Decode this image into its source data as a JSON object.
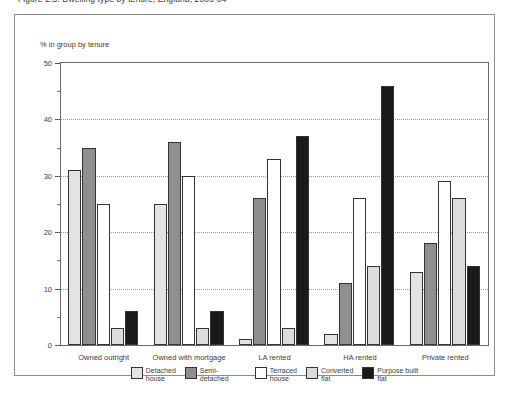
{
  "figure": {
    "title_clipped": "Figure 2.5: Dwelling type by tenure, England, 2003-04",
    "axis_title": "% in group by tenure"
  },
  "chart_data": {
    "type": "bar",
    "title": "",
    "xlabel": "",
    "ylabel": "% in group by tenure",
    "ylim": [
      0,
      50
    ],
    "ytick_step": 10,
    "yminor_step": 5,
    "grid": "horizontal-dotted",
    "legend_position": "bottom-center",
    "ytick_labels": [
      "0",
      "10",
      "20",
      "30",
      "40",
      "50"
    ],
    "categories": [
      "Owned outright",
      "Owned with mortgage",
      "LA rented",
      "HA rented",
      "Private rented"
    ],
    "series": [
      {
        "name": "Detached\nhouse",
        "legend_label": "Detached\nhouse",
        "color": "#e3e3e3",
        "values": [
          31,
          25,
          1,
          2,
          13
        ]
      },
      {
        "name": "Semi-detached",
        "legend_label": "Semi-detached",
        "color": "#8f8f8f",
        "values": [
          35,
          36,
          26,
          11,
          18
        ]
      },
      {
        "name": "Terraced\nhouse",
        "legend_label": "Terraced\nhouse",
        "color": "#ffffff",
        "values": [
          25,
          30,
          33,
          26,
          29
        ]
      },
      {
        "name": "Converted\nflat",
        "legend_label": "Converted\nflat",
        "color": "#dcdcdc",
        "values": [
          3,
          3,
          3,
          14,
          26
        ]
      },
      {
        "name": "Purpose built\nflat",
        "legend_label": "Purpose built\nflat",
        "color": "#1a1a1a",
        "values": [
          6,
          6,
          37,
          46,
          14
        ]
      }
    ]
  }
}
